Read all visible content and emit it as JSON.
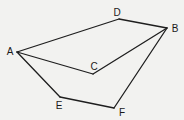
{
  "diagram": {
    "type": "geometric-figure",
    "points": [
      {
        "id": "A",
        "label": "A",
        "x": 17,
        "y": 52,
        "lx": 10,
        "ly": 51
      },
      {
        "id": "B",
        "label": "B",
        "x": 167,
        "y": 28,
        "lx": 175,
        "ly": 28
      },
      {
        "id": "C",
        "label": "C",
        "x": 93,
        "y": 74,
        "lx": 94,
        "ly": 66
      },
      {
        "id": "D",
        "label": "D",
        "x": 119,
        "y": 19,
        "lx": 117,
        "ly": 12
      },
      {
        "id": "E",
        "label": "E",
        "x": 60,
        "y": 97,
        "lx": 59,
        "ly": 105
      },
      {
        "id": "F",
        "label": "F",
        "x": 114,
        "y": 108,
        "lx": 122,
        "ly": 112
      }
    ],
    "edges": [
      [
        "A",
        "D"
      ],
      [
        "D",
        "B"
      ],
      [
        "A",
        "C"
      ],
      [
        "C",
        "B"
      ],
      [
        "A",
        "E"
      ],
      [
        "E",
        "F"
      ],
      [
        "F",
        "B"
      ]
    ],
    "colors": {
      "line": "#1e1e1e",
      "background": "#f2f2f0",
      "text": "#1a1a1a"
    }
  }
}
